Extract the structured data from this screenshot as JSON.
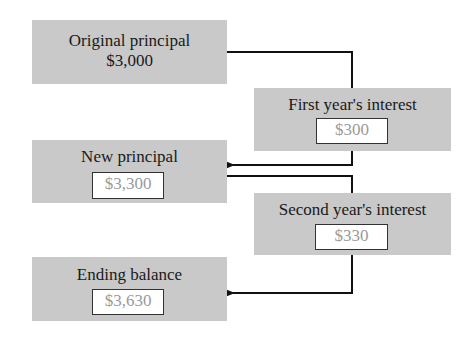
{
  "diagram": {
    "title": "",
    "nodes": [
      {
        "id": "original_principal",
        "label": "Original principal",
        "value": "$3,000",
        "value_boxed": false
      },
      {
        "id": "first_year_interest",
        "label": "First year's interest",
        "value": "$300",
        "value_boxed": true
      },
      {
        "id": "new_principal",
        "label": "New principal",
        "value": "$3,300",
        "value_boxed": true
      },
      {
        "id": "second_year_interest",
        "label": "Second year's interest",
        "value": "$330",
        "value_boxed": true
      },
      {
        "id": "ending_balance",
        "label": "Ending balance",
        "value": "$3,630",
        "value_boxed": true
      }
    ],
    "edges": [
      {
        "from": "original_principal",
        "to": "first_year_interest",
        "arrow": false
      },
      {
        "from": "first_year_interest",
        "to": "new_principal",
        "arrow": true
      },
      {
        "from": "new_principal",
        "to": "second_year_interest",
        "arrow": false
      },
      {
        "from": "second_year_interest",
        "to": "ending_balance",
        "arrow": true
      }
    ],
    "colors": {
      "box_fill": "#c9c9c9",
      "value_text": "#9a9a9a",
      "label_text": "#1a1a1a",
      "line": "#111111"
    }
  }
}
